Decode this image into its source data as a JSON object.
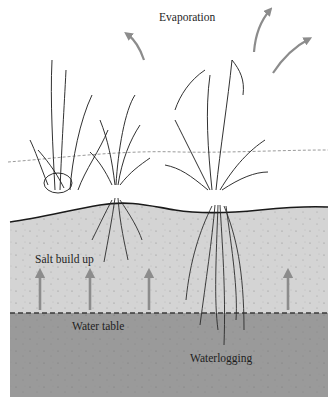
{
  "diagram": {
    "labels": {
      "evaporation": "Evaporation",
      "salt_build_up": "Salt build up",
      "water_table": "Water table",
      "waterlogging": "Waterlogging"
    },
    "layers": [
      {
        "name": "surface-vegetation",
        "color": "#ffffff"
      },
      {
        "name": "unsaturated-soil",
        "color": "#d4d4d4"
      },
      {
        "name": "saturated-zone",
        "color": "#9a9a9a"
      }
    ],
    "colors": {
      "arrow": "#8c8c8c",
      "outline": "#1a1a1a",
      "water_table_line": "#3a3a3a"
    },
    "evaporation_arrows": 3,
    "salt_arrows": 4
  }
}
